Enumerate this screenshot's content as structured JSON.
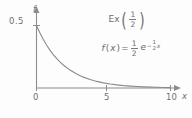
{
  "chart_data": {
    "type": "line",
    "annotation": "f(x) = 1/2 e^(-x/2)",
    "xlabel": "x",
    "ylabel": "f",
    "xlim": [
      0,
      10.6
    ],
    "ylim": [
      0,
      0.57
    ],
    "grid": false,
    "legend_position": "none",
    "x_ticks": [
      "0",
      "5",
      "10"
    ],
    "x_tick_values": [
      0,
      5,
      10
    ],
    "y_ticks": [
      "0.5"
    ],
    "y_tick_values": [
      0.5
    ],
    "series": [
      {
        "name": "f(x) = 0.5 * exp(-x/2)",
        "x": [
          0,
          0.25,
          0.5,
          0.75,
          1,
          1.25,
          1.5,
          1.75,
          2,
          2.5,
          3,
          3.5,
          4,
          4.5,
          5,
          5.5,
          6,
          6.5,
          7,
          7.5,
          8,
          8.5,
          9,
          9.5,
          10
        ],
        "values": [
          0.5,
          0.4412,
          0.3894,
          0.3436,
          0.3033,
          0.2676,
          0.2362,
          0.2084,
          0.1839,
          0.1433,
          0.1116,
          0.0869,
          0.0677,
          0.0527,
          0.041,
          0.032,
          0.0249,
          0.0194,
          0.0151,
          0.0118,
          0.0092,
          0.0071,
          0.0056,
          0.0044,
          0.0034
        ]
      }
    ]
  },
  "figure": {
    "title_parts": {
      "name": "Ex",
      "open_paren": "(",
      "numerator": "1",
      "denominator": "2",
      "close_paren": ")"
    },
    "pdf_parts": {
      "function": "f",
      "open_paren": "(",
      "variable": "x",
      "close_paren": ")",
      "equals": "=",
      "coef_numerator": "1",
      "coef_denominator": "2",
      "base": "e",
      "exp_minus": "−",
      "exp_numerator": "1",
      "exp_denominator": "2",
      "exp_variable": "x"
    },
    "axes": {
      "y_label": "f",
      "x_label": "x",
      "y_tick_05": "0.5",
      "x_tick_0": "0",
      "x_tick_5": "5",
      "x_tick_10": "10"
    },
    "colors": {
      "background": "#fdfdfd",
      "axis": "#8c8c8c",
      "curve": "#8a8a8a",
      "text": "#6b6b6b"
    }
  }
}
